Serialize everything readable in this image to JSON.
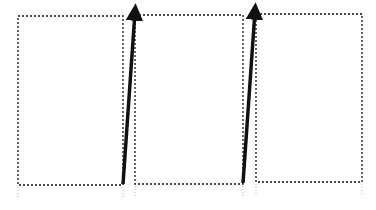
{
  "diagram": {
    "background": "#ffffff",
    "stroke_color": "#111111",
    "panels": [
      {
        "id": "panel-1",
        "x": 18,
        "y": 16,
        "width": 105,
        "height": 169
      },
      {
        "id": "panel-2",
        "x": 135,
        "y": 15,
        "width": 108,
        "height": 169
      },
      {
        "id": "panel-3",
        "x": 256,
        "y": 14,
        "width": 106,
        "height": 168
      }
    ],
    "arrows": [
      {
        "id": "arrow-1",
        "x1": 123,
        "y1": 184,
        "x2": 135,
        "y2": 12
      },
      {
        "id": "arrow-2",
        "x1": 243,
        "y1": 183,
        "x2": 255,
        "y2": 11
      }
    ]
  }
}
